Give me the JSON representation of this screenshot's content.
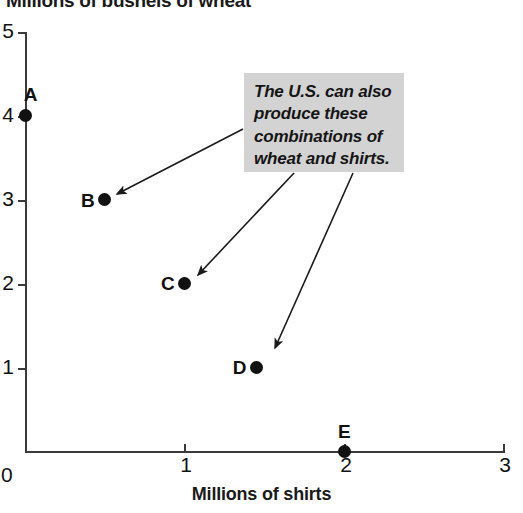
{
  "chart_data": {
    "type": "scatter",
    "title": "Millions of bushels of wheat",
    "xlabel": "Millions of shirts",
    "ylabel": "Millions of bushels of wheat",
    "xlim": [
      0,
      3
    ],
    "ylim": [
      0,
      5
    ],
    "grid": false,
    "legend": "none",
    "x_ticks": [
      "1",
      "2",
      "3"
    ],
    "x_tick_values": [
      1,
      2,
      3
    ],
    "y_ticks": [
      "1",
      "2",
      "3",
      "4",
      "5"
    ],
    "y_tick_values": [
      1,
      2,
      3,
      4,
      5
    ],
    "origin_label": "0",
    "points": [
      {
        "label": "A",
        "x": 0,
        "y": 4,
        "label_position": "above-right"
      },
      {
        "label": "B",
        "x": 0.5,
        "y": 3,
        "label_position": "left"
      },
      {
        "label": "C",
        "x": 1.0,
        "y": 2,
        "label_position": "left"
      },
      {
        "label": "D",
        "x": 1.45,
        "y": 1,
        "label_position": "left"
      },
      {
        "label": "E",
        "x": 2.0,
        "y": 0,
        "label_position": "above"
      }
    ],
    "annotations": [
      {
        "text": "The U.S. can also produce these combinations of wheat and shirts.",
        "lines": [
          "The U.S. can also",
          "produce these",
          "combinations of",
          "wheat and shirts."
        ],
        "points_to": [
          "B",
          "C",
          "D"
        ]
      }
    ],
    "colors": {
      "point": "#111111",
      "axis": "#3a3a3a",
      "callout_background": "#d3d3d3",
      "text": "#111111",
      "page_background": "#ffffff"
    }
  }
}
